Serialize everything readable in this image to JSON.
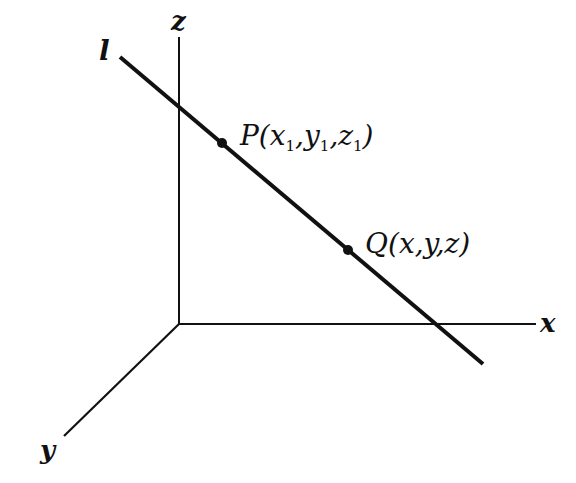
{
  "diagram": {
    "type": "3d-coordinate-line",
    "colors": {
      "stroke": "#111111",
      "background": "#ffffff"
    },
    "axes": {
      "z": {
        "label": "z"
      },
      "x": {
        "label": "x"
      },
      "y": {
        "label": "y"
      }
    },
    "line": {
      "label": "l"
    },
    "points": [
      {
        "name": "P",
        "label_main": "P(x",
        "sub1": "1",
        "sep1": ",y",
        "sub2": "1",
        "sep2": ",z",
        "sub3": "1",
        "close": ")"
      },
      {
        "name": "Q",
        "label": "Q(x,y,z)"
      }
    ]
  }
}
